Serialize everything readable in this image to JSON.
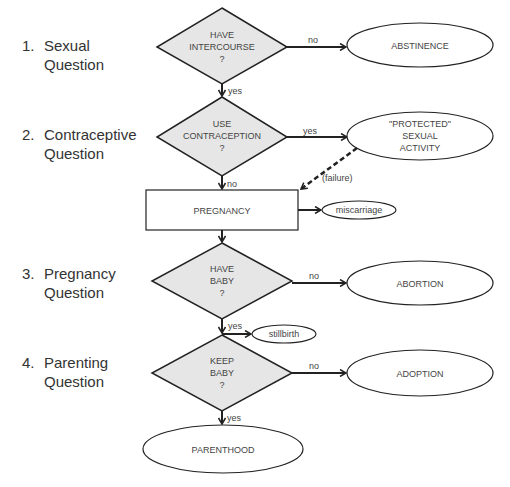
{
  "stages": [
    {
      "number": "1.",
      "line1": "Sexual",
      "line2": "Question"
    },
    {
      "number": "2.",
      "line1": "Contraceptive",
      "line2": "Question"
    },
    {
      "number": "3.",
      "line1": "Pregnancy",
      "line2": "Question"
    },
    {
      "number": "4.",
      "line1": "Parenting",
      "line2": "Question"
    }
  ],
  "decisions": [
    {
      "line1": "HAVE",
      "line2": "INTERCOURSE",
      "line3": "?"
    },
    {
      "line1": "USE",
      "line2": "CONTRACEPTION",
      "line3": "?"
    },
    {
      "line1": "HAVE",
      "line2": "BABY",
      "line3": "?"
    },
    {
      "line1": "KEEP",
      "line2": "BABY",
      "line3": "?"
    }
  ],
  "process": {
    "pregnancy": "PREGNANCY"
  },
  "outcomes": {
    "abstinence": "ABSTINENCE",
    "protected": {
      "line1": "\"PROTECTED\"",
      "line2": "SEXUAL",
      "line3": "ACTIVITY"
    },
    "miscarriage": "miscarriage",
    "abortion": "ABORTION",
    "stillbirth": "stillbirth",
    "adoption": "ADOPTION",
    "parenthood": "PARENTHOOD"
  },
  "edges": {
    "d1_no": "no",
    "d1_yes": "yes",
    "d2_yes": "yes",
    "d2_no": "no",
    "failure": "(failure)",
    "d3_no": "no",
    "d3_yes": "yes",
    "d4_no": "no",
    "d4_yes": "yes"
  },
  "colors": {
    "diamond_fill": "#e6e6e6",
    "stroke": "#222222",
    "text": "#444444"
  }
}
